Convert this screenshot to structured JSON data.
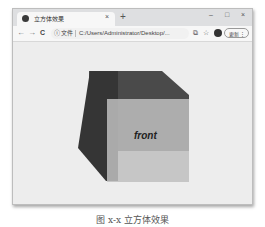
{
  "browser": {
    "tab": {
      "title": "立方体效果",
      "icon": "globe-icon",
      "close": "×"
    },
    "new_tab": "+",
    "window_controls": {
      "minimize": "–",
      "maximize": "□",
      "close": "×"
    },
    "toolbar": {
      "back": "←",
      "forward": "→",
      "reload": "C",
      "info_icon": "ⓘ",
      "scheme_label": "文件",
      "url": "C:/Users/Administrator/Desktop/...",
      "share_icon": "⧉",
      "bookmark_icon": "☆",
      "update_label": "更新",
      "menu_icon": "⋮"
    }
  },
  "page": {
    "cube": {
      "front_label": "front"
    }
  },
  "caption": "图 x-x  立方体效果"
}
